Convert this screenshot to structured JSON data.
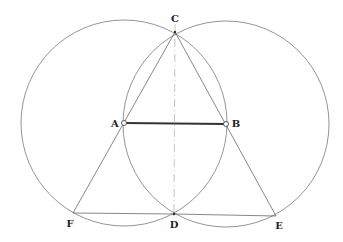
{
  "diagram": {
    "colors": {
      "stroke": "#555555",
      "thick": "#333333",
      "axis": "#aaaaaa",
      "label": "#222222"
    },
    "points": {
      "A": {
        "label": "A",
        "x": 124,
        "y": 123
      },
      "B": {
        "label": "B",
        "x": 226,
        "y": 124
      },
      "C": {
        "label": "C",
        "x": 175,
        "y": 32
      },
      "D": {
        "label": "D",
        "x": 174,
        "y": 214
      },
      "E": {
        "label": "E",
        "x": 276,
        "y": 216
      },
      "F": {
        "label": "F",
        "x": 73,
        "y": 213
      }
    },
    "circles": [
      {
        "center": "A",
        "radius": 103
      },
      {
        "center": "B",
        "radius": 103
      }
    ],
    "segments": [
      {
        "from": "A",
        "to": "B",
        "style": "thick"
      },
      {
        "from": "C",
        "to": "F",
        "style": "thin"
      },
      {
        "from": "C",
        "to": "E",
        "style": "thin"
      },
      {
        "from": "F",
        "to": "E",
        "style": "thin"
      },
      {
        "from": "C",
        "to": "D",
        "style": "dash-dot"
      }
    ]
  }
}
